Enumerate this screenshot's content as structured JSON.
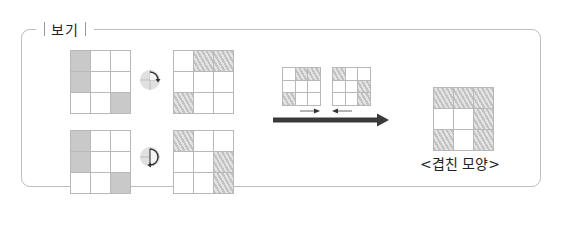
{
  "box": {
    "title": "보기"
  },
  "figures": {
    "row1": {
      "original": {
        "cells": [
          "s",
          "",
          "",
          "s",
          "",
          "",
          "",
          "",
          "s"
        ]
      },
      "rotation_icon": "rotate-90-clockwise-icon",
      "result": {
        "cells": [
          "",
          "h",
          "h",
          "",
          "",
          "",
          "h",
          "",
          ""
        ]
      }
    },
    "row2": {
      "original": {
        "cells": [
          "s",
          "",
          "",
          "s",
          "",
          "",
          "",
          "",
          "s"
        ]
      },
      "rotation_icon": "rotate-180-clockwise-icon",
      "result": {
        "cells": [
          "h",
          "",
          "",
          "",
          "",
          "h",
          "",
          "",
          "h"
        ]
      }
    },
    "slide": {
      "left": {
        "cells": [
          "",
          "h",
          "h",
          "",
          "",
          "",
          "h",
          "",
          ""
        ]
      },
      "right": {
        "cells": [
          "h",
          "",
          "",
          "",
          "",
          "h",
          "",
          "",
          "h"
        ]
      },
      "arrows": [
        "right-arrow-icon",
        "left-arrow-icon"
      ],
      "main_arrow": "long-right-arrow-icon"
    },
    "overlap": {
      "cells": [
        "h",
        "h",
        "h",
        "",
        "",
        "h",
        "h",
        "",
        "h"
      ],
      "caption": "<겹친 모양>"
    }
  },
  "colors": {
    "border": "#bdbdbd",
    "solid_fill": "#c9c9c9",
    "hatch_dark": "#c2c2c2",
    "hatch_light": "#e4e4e4",
    "arrow": "#3a3a3a"
  }
}
